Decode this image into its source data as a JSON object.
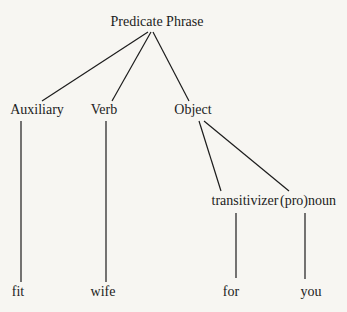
{
  "diagram": {
    "type": "tree",
    "root": {
      "label": "Predicate Phrase",
      "children": [
        {
          "label": "Auxiliary",
          "children": [
            {
              "label": "fit"
            }
          ]
        },
        {
          "label": "Verb",
          "children": [
            {
              "label": "wife"
            }
          ]
        },
        {
          "label": "Object",
          "children": [
            {
              "label": "transitivizer",
              "children": [
                {
                  "label": "for"
                }
              ]
            },
            {
              "label": "(pro)noun",
              "children": [
                {
                  "label": "you"
                }
              ]
            }
          ]
        }
      ]
    }
  },
  "nodes": {
    "root": "Predicate Phrase",
    "auxiliary": "Auxiliary",
    "verb": "Verb",
    "object": "Object",
    "transitivizer": "transitivizer",
    "pronoun": "(pro)noun",
    "fit": "fit",
    "wife": "wife",
    "for": "for",
    "you": "you"
  },
  "colors": {
    "background": "#f7f6f2",
    "ink": "#1c1c1c"
  }
}
